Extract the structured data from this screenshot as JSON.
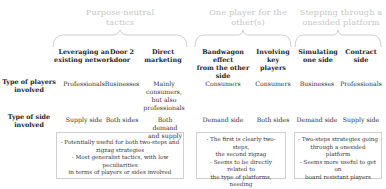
{
  "groups": [
    {
      "title_line1": "Purpose-neutral",
      "title_line2": "tactics"
    },
    {
      "title_line1": "One player for the",
      "title_line2": "other(s)"
    },
    {
      "title_line1": "Stepping through a",
      "title_line2": "onesided platform"
    }
  ],
  "columns": [
    {
      "line1": "Leveraging an",
      "line2": "existing network"
    },
    {
      "line1": "Door 2",
      "line2": "door"
    },
    {
      "line1": "Direct",
      "line2": "marketing"
    },
    {
      "line1": "Bandwagon effect",
      "line2": "from the other side"
    },
    {
      "line1": "Involving",
      "line2": "key players"
    },
    {
      "line1": "Simulating",
      "line2": "one side"
    },
    {
      "line1": "Contract",
      "line2": "side"
    }
  ],
  "rows": [
    {
      "label_line1": "Type of players",
      "label_line2": "involved",
      "cells": [
        "Professionals",
        "Businesses",
        "Mainly consumers, but also professionals",
        "Consumers",
        "Consumers",
        "Businesses",
        "Professionals"
      ]
    },
    {
      "label_line1": "Type of side",
      "label_line2": "involved",
      "cells": [
        "Supply side",
        "Both sides",
        "Both demand and supply",
        "Demand side",
        "Both sides",
        "Demand side",
        "Supply side"
      ]
    }
  ],
  "notes": [
    {
      "lines": [
        "- Potentially useful for both two-steps and",
        "zigzag strategies",
        "- Most generalist tactics, with low peculiarities",
        "in terms of players or sides involved"
      ]
    },
    {
      "lines": [
        "- The first is clearly two-steps,",
        "the second zigzag",
        "- Seems to be directly related to",
        "the type of platforms, needing",
        "a physical dimension"
      ]
    },
    {
      "lines": [
        "- Two-steps strategies going",
        "through a onesided",
        "platform",
        "- Seems more useful to get on",
        "board resistant players"
      ]
    }
  ],
  "colors": {
    "group_title": "#c6c6c6",
    "brace": "#c8c8c8",
    "note_border": "#cfcfcf",
    "text": "#222222"
  }
}
